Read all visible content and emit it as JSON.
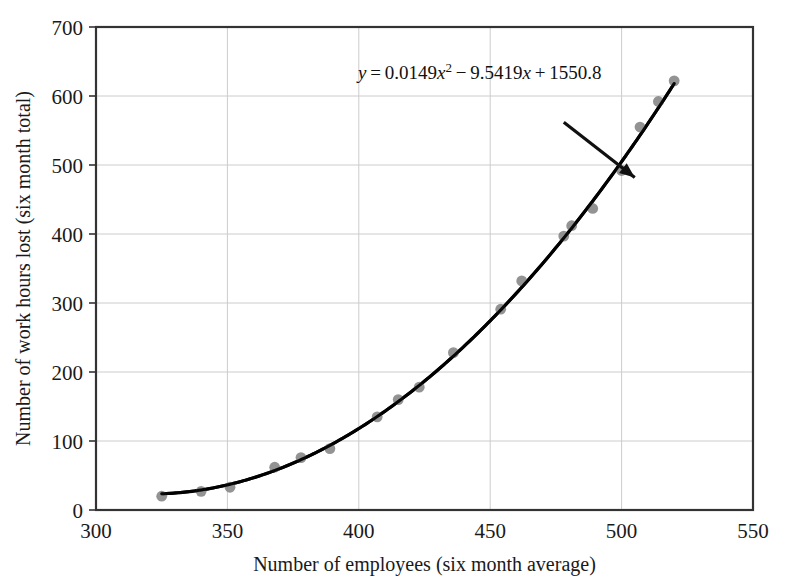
{
  "chart_data": {
    "type": "scatter",
    "title": "",
    "xlabel": "Number of employees (six month average)",
    "ylabel": "Number of work hours lost (six month total)",
    "xlim": [
      300,
      550
    ],
    "ylim": [
      0,
      700
    ],
    "xticks": [
      300,
      350,
      400,
      450,
      500,
      550
    ],
    "yticks": [
      0,
      100,
      200,
      300,
      400,
      500,
      600,
      700
    ],
    "grid": true,
    "legend": null,
    "marker_color": "#808080",
    "curve_color": "#000000",
    "grid_color": "#cccccc",
    "axis_color": "#333333",
    "points": [
      {
        "x": 325,
        "y": 20
      },
      {
        "x": 340,
        "y": 27
      },
      {
        "x": 351,
        "y": 33
      },
      {
        "x": 368,
        "y": 62
      },
      {
        "x": 378,
        "y": 76
      },
      {
        "x": 389,
        "y": 89
      },
      {
        "x": 407,
        "y": 135
      },
      {
        "x": 415,
        "y": 160
      },
      {
        "x": 423,
        "y": 178
      },
      {
        "x": 436,
        "y": 228
      },
      {
        "x": 454,
        "y": 291
      },
      {
        "x": 462,
        "y": 332
      },
      {
        "x": 478,
        "y": 397
      },
      {
        "x": 481,
        "y": 412
      },
      {
        "x": 489,
        "y": 437
      },
      {
        "x": 500,
        "y": 492
      },
      {
        "x": 507,
        "y": 555
      },
      {
        "x": 514,
        "y": 592
      },
      {
        "x": 520,
        "y": 622
      }
    ],
    "fit": {
      "type": "quadratic",
      "a": 0.0149,
      "b": -9.5419,
      "c": 1550.8,
      "x_start": 325,
      "x_end": 520,
      "label_parts": {
        "y": "y",
        "eq": "=",
        "a_term": "0.0149",
        "x_var": "x",
        "exponent": "2",
        "minus": "−",
        "b_term": "9.5419",
        "plus": "+",
        "c_term": "1550.8"
      },
      "label_full": "y = 0.0149x² − 9.5419x + 1550.8"
    },
    "annotation_arrow": {
      "from_x": 478,
      "from_y": 562,
      "to_x": 505,
      "to_y": 482
    }
  }
}
